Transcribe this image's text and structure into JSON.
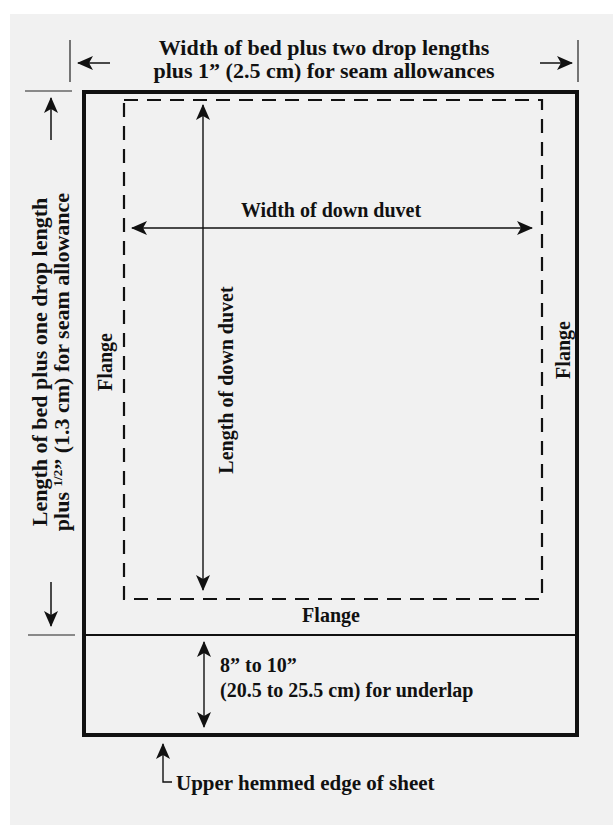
{
  "page_top_fragment": "",
  "diagram": {
    "top_dimension": {
      "line1": "Width of bed plus two drop lengths",
      "line2": "plus 1” (2.5 cm) for seam allowances"
    },
    "left_dimension": {
      "line1": "Length of bed plus one drop length",
      "line2_prefix": "plus ",
      "line2_fraction": "1/2",
      "line2_suffix": "” (1.3 cm) for seam allowance"
    },
    "inner_width_label": "Width of down duvet",
    "inner_length_label": "Length of down duvet",
    "flange_left": "Flange",
    "flange_right": "Flange",
    "flange_bottom": "Flange",
    "underlap": {
      "line1": "8” to 10”",
      "line2": "(20.5 to 25.5 cm) for underlap"
    },
    "bottom_callout": "Upper hemmed edge of sheet",
    "colors": {
      "background": "#f1f1f1",
      "ink": "#111111"
    }
  }
}
